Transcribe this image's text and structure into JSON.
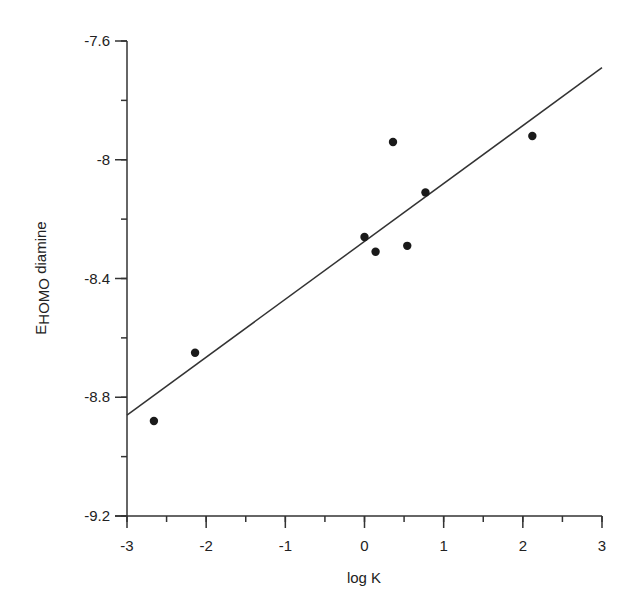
{
  "chart_data": {
    "type": "scatter",
    "title": "",
    "xlabel": "log K",
    "ylabel": "EHOMO diamine",
    "ylabel_parts": {
      "main": "E",
      "sub": "HOMO",
      "rest": " diamine"
    },
    "xlim": [
      -3,
      3
    ],
    "ylim": [
      -9.2,
      -7.6
    ],
    "x_ticks": [
      -3,
      -2,
      -1,
      0,
      1,
      2,
      3
    ],
    "x_tick_labels": [
      "-3",
      "-2",
      "-1",
      "0",
      "1",
      "2",
      "3"
    ],
    "x_minor_step": 0.5,
    "y_ticks": [
      -9.2,
      -8.8,
      -8.4,
      -8.0,
      -7.6
    ],
    "y_tick_labels": [
      "-9.2",
      "-8.8",
      "-8.4",
      "-8",
      "-7.6"
    ],
    "y_minor_step": 0.2,
    "grid": false,
    "legend": null,
    "series": [
      {
        "name": "data",
        "marker": "filled-circle",
        "x": [
          -2.66,
          -2.14,
          0.0,
          0.14,
          0.36,
          0.54,
          0.77,
          2.12
        ],
        "y": [
          -8.88,
          -8.65,
          -8.26,
          -8.31,
          -7.94,
          -8.29,
          -8.11,
          -7.92
        ]
      },
      {
        "name": "linear fit",
        "marker": "line",
        "x": [
          -3,
          3
        ],
        "y": [
          -8.86,
          -7.69
        ]
      }
    ],
    "colors": {
      "axis": "#333333",
      "points": "#1a1a1a",
      "line": "#333333",
      "background": "#ffffff"
    }
  }
}
